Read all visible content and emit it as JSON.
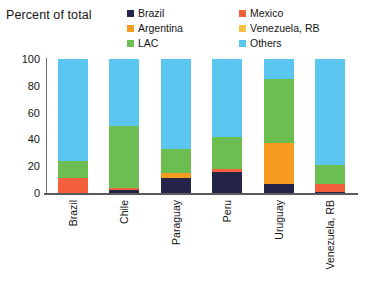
{
  "chart_data": {
    "type": "bar",
    "subtype": "stacked-100",
    "title": "Percent of total",
    "xlabel": "",
    "ylabel": "",
    "ylim": [
      0,
      100
    ],
    "yticks": [
      0,
      20,
      40,
      60,
      80,
      100
    ],
    "grid": false,
    "legend_position": "top-right",
    "categories": [
      "Brazil",
      "Chile",
      "Paraguay",
      "Peru",
      "Uruguay",
      "Venezuela, RB"
    ],
    "series": [
      {
        "name": "Brazil",
        "color": "#232448",
        "values": [
          0,
          2,
          11,
          16,
          7,
          1
        ]
      },
      {
        "name": "Mexico",
        "color": "#F4603C",
        "values": [
          11,
          2,
          0,
          2,
          0,
          6
        ]
      },
      {
        "name": "Argentina",
        "color": "#F79C1E",
        "values": [
          0,
          0,
          4,
          0,
          30,
          0
        ]
      },
      {
        "name": "Venezuela, RB",
        "color": "#F5C344",
        "values": [
          0,
          0,
          0,
          0,
          0,
          0
        ]
      },
      {
        "name": "LAC",
        "color": "#6CBE51",
        "values": [
          13,
          46,
          18,
          24,
          48,
          14
        ]
      },
      {
        "name": "Others",
        "color": "#5BC6F0",
        "values": [
          76,
          50,
          67,
          58,
          15,
          79
        ]
      }
    ]
  },
  "legend": {
    "items": [
      {
        "label": "Brazil",
        "color": "#232448"
      },
      {
        "label": "Mexico",
        "color": "#F4603C"
      },
      {
        "label": "Argentina",
        "color": "#F79C1E"
      },
      {
        "label": "Venezuela, RB",
        "color": "#F5C344"
      },
      {
        "label": "LAC",
        "color": "#6CBE51"
      },
      {
        "label": "Others",
        "color": "#5BC6F0"
      }
    ],
    "order": [
      0,
      1,
      2,
      3,
      4,
      5
    ]
  }
}
